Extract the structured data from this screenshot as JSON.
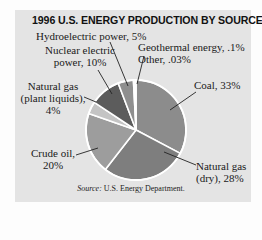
{
  "chart_data": {
    "type": "pie",
    "title": "1996 U.S. ENERGY PRODUCTION BY SOURCE",
    "categories": [
      "Coal",
      "Natural gas (dry)",
      "Crude oil",
      "Natural gas (plant liquids)",
      "Nuclear electric power",
      "Hydroelectric power",
      "Geothermal energy",
      "Other"
    ],
    "values": [
      33,
      28,
      20,
      4,
      10,
      5,
      0.1,
      0.03
    ],
    "unit": "%",
    "start_angle": "12 o'clock, clockwise",
    "colors": [
      "#8c8c8c",
      "#7e7e7e",
      "#9d9d9d",
      "#c4c4c4",
      "#5c5c5c",
      "#8f8f8f",
      "#888888",
      "#888888"
    ],
    "labels": {
      "coal": "Coal, 33%",
      "natgas_dry_1": "Natural gas",
      "natgas_dry_2": "(dry), 28%",
      "crude_1": "Crude oil,",
      "crude_2": "20%",
      "ngpl_1": "Natural gas",
      "ngpl_2": "(plant liquids),",
      "ngpl_3": "4%",
      "nuclear_1": "Nuclear electric",
      "nuclear_2": "power, 10%",
      "hydro": "Hydroelectric power, 5%",
      "geothermal": "Geothermal energy, .1%",
      "other": "Other, .03%"
    },
    "source_label": "Source:",
    "source_text": "U.S. Energy Department.",
    "legend": "none (direct labels)"
  }
}
